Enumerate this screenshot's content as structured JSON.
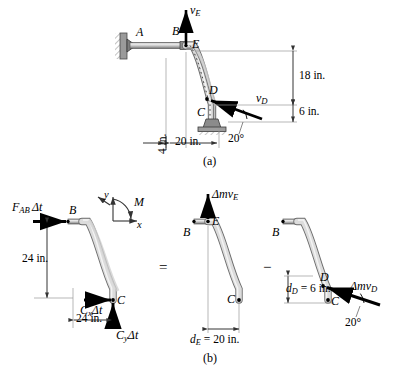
{
  "figure": {
    "title_a": "(a)",
    "title_b": "(b)",
    "operator_equals": "=",
    "operator_minus": "−"
  },
  "panel_a": {
    "name": "rod-assembly-kinematics",
    "points": {
      "A": "A",
      "B": "B",
      "E": "E",
      "C": "C",
      "D": "D"
    },
    "vectors": {
      "vE": {
        "symbol": "v",
        "subscript": "E",
        "direction": "up"
      },
      "vD": {
        "symbol": "v",
        "subscript": "D",
        "direction": "up-left-20deg"
      }
    },
    "dimensions": {
      "d18": "18 in.",
      "d6": "6 in.",
      "d4": "4 in.",
      "d20": "20 in.",
      "angle": "20°"
    }
  },
  "panel_b_left": {
    "name": "impulse-diagram",
    "points": {
      "B": "B",
      "C": "C"
    },
    "forces": {
      "FAB": {
        "symbol": "F",
        "subscript": "AB",
        "suffix": "Δt"
      },
      "Cx": {
        "symbol": "C",
        "subscript": "x",
        "suffix": "Δt"
      },
      "Cy": {
        "symbol": "C",
        "subscript": "y",
        "suffix": "Δt"
      }
    },
    "dimensions": {
      "vertical": "24 in.",
      "horizontal": "24 in."
    },
    "axes": {
      "x_label": "x",
      "y_label": "y",
      "moment_label": "M"
    }
  },
  "panel_b_mid": {
    "name": "final-momentum-diagram",
    "points": {
      "B": "B",
      "E": "E",
      "C": "C"
    },
    "momentum": {
      "symbol": "Δmv",
      "subscript": "E"
    },
    "dimension": {
      "symbol": "d",
      "subscript": "E",
      "value": "= 20 in."
    }
  },
  "panel_b_right": {
    "name": "initial-momentum-diagram",
    "points": {
      "B": "B",
      "C": "C",
      "D": "D"
    },
    "momentum": {
      "symbol": "Δmv",
      "subscript": "D"
    },
    "dimension": {
      "symbol": "d",
      "subscript": "D",
      "value": "= 6 in."
    },
    "angle": "20°"
  },
  "colors": {
    "ink": "#000000",
    "rod_light": "#e8e8e8",
    "rod_mid": "#bdbdbd",
    "rod_dark": "#8a8a8a",
    "thin_line": "#9a9a9a"
  }
}
